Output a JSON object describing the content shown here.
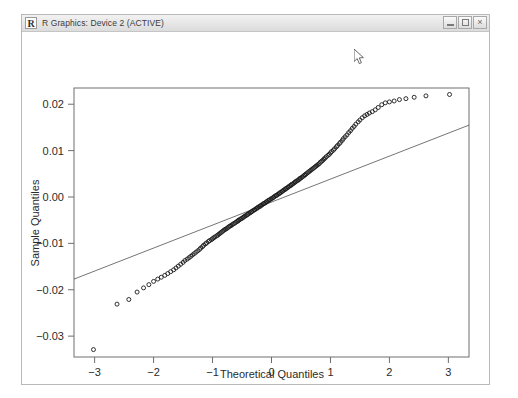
{
  "window": {
    "title": "R Graphics: Device 2 (ACTIVE)",
    "icon": "r-logo-icon",
    "icon_letter": "R",
    "controls": {
      "minimize_label": "",
      "maximize_label": "",
      "close_label": "×"
    },
    "frame_color": "#b9b9b9",
    "titlebar_color": "#e8e8e8"
  },
  "cursor": {
    "x": 357,
    "y": 55,
    "kind": "arrow-pointer"
  },
  "chart_data": {
    "type": "scatter",
    "title": "",
    "xlabel": "Theoretical Quantiles",
    "ylabel": "Sample Quantiles",
    "xlim": [
      -3.35,
      3.35
    ],
    "ylim": [
      -0.0345,
      0.0235
    ],
    "xticks": [
      -3,
      -2,
      -1,
      0,
      1,
      2,
      3
    ],
    "xtick_labels": [
      "−3",
      "−2",
      "−1",
      "0",
      "1",
      "2",
      "3"
    ],
    "yticks": [
      0.02,
      0.01,
      0.0,
      -0.01,
      -0.02,
      -0.03
    ],
    "ytick_labels": [
      "0.02",
      "0.01",
      "0.00",
      "−0.01",
      "−0.02",
      "−0.03"
    ],
    "grid": false,
    "legend": null,
    "marker": {
      "shape": "open-circle",
      "radius": 2.0,
      "color": "#1a1a1a"
    },
    "reference_line": {
      "name": "qqline",
      "color": "#3a3a3a",
      "width": 0.7,
      "x1": -3.35,
      "y1": -0.0177,
      "x2": 3.35,
      "y2": 0.0155
    },
    "series": [
      {
        "name": "Sample Quantiles",
        "x": [
          -3.02,
          -2.62,
          -2.42,
          -2.28,
          -2.17,
          -2.08,
          -2.0,
          -1.93,
          -1.87,
          -1.81,
          -1.76,
          -1.71,
          -1.66,
          -1.62,
          -1.58,
          -1.54,
          -1.5,
          -1.47,
          -1.43,
          -1.4,
          -1.37,
          -1.34,
          -1.31,
          -1.28,
          -1.25,
          -1.22,
          -1.2,
          -1.17,
          -1.15,
          -1.12,
          -1.1,
          -1.07,
          -1.05,
          -1.02,
          -1.0,
          -0.98,
          -0.96,
          -0.93,
          -0.91,
          -0.89,
          -0.87,
          -0.85,
          -0.83,
          -0.81,
          -0.79,
          -0.77,
          -0.75,
          -0.73,
          -0.71,
          -0.69,
          -0.67,
          -0.65,
          -0.63,
          -0.61,
          -0.59,
          -0.57,
          -0.56,
          -0.54,
          -0.52,
          -0.5,
          -0.48,
          -0.47,
          -0.45,
          -0.43,
          -0.41,
          -0.4,
          -0.38,
          -0.36,
          -0.34,
          -0.33,
          -0.31,
          -0.29,
          -0.28,
          -0.26,
          -0.24,
          -0.23,
          -0.21,
          -0.19,
          -0.18,
          -0.16,
          -0.14,
          -0.13,
          -0.11,
          -0.09,
          -0.08,
          -0.06,
          -0.04,
          -0.03,
          -0.01,
          0.01,
          0.03,
          0.04,
          0.06,
          0.08,
          0.09,
          0.11,
          0.13,
          0.14,
          0.16,
          0.18,
          0.19,
          0.21,
          0.23,
          0.24,
          0.26,
          0.28,
          0.29,
          0.31,
          0.33,
          0.34,
          0.36,
          0.38,
          0.4,
          0.41,
          0.43,
          0.45,
          0.47,
          0.48,
          0.5,
          0.52,
          0.54,
          0.56,
          0.57,
          0.59,
          0.61,
          0.63,
          0.65,
          0.67,
          0.69,
          0.71,
          0.73,
          0.75,
          0.77,
          0.79,
          0.81,
          0.83,
          0.85,
          0.87,
          0.89,
          0.91,
          0.93,
          0.96,
          0.98,
          1.0,
          1.02,
          1.05,
          1.07,
          1.1,
          1.12,
          1.15,
          1.17,
          1.2,
          1.22,
          1.25,
          1.28,
          1.31,
          1.34,
          1.37,
          1.4,
          1.43,
          1.47,
          1.5,
          1.54,
          1.58,
          1.62,
          1.66,
          1.71,
          1.76,
          1.81,
          1.87,
          1.93,
          2.0,
          2.08,
          2.17,
          2.28,
          2.42,
          2.62,
          3.02
        ],
        "y": [
          -0.0329,
          -0.0231,
          -0.0221,
          -0.0205,
          -0.0196,
          -0.0189,
          -0.0182,
          -0.0177,
          -0.0173,
          -0.0169,
          -0.0165,
          -0.0161,
          -0.0157,
          -0.0153,
          -0.0149,
          -0.0145,
          -0.0141,
          -0.0137,
          -0.0134,
          -0.0131,
          -0.0128,
          -0.0125,
          -0.0122,
          -0.0119,
          -0.0116,
          -0.0113,
          -0.011,
          -0.0107,
          -0.0104,
          -0.0101,
          -0.0099,
          -0.0096,
          -0.0094,
          -0.0092,
          -0.009,
          -0.0088,
          -0.0086,
          -0.0084,
          -0.0082,
          -0.008,
          -0.0078,
          -0.0076,
          -0.0074,
          -0.0072,
          -0.007,
          -0.0069,
          -0.0067,
          -0.0065,
          -0.0063,
          -0.0062,
          -0.006,
          -0.0058,
          -0.0057,
          -0.0055,
          -0.0053,
          -0.0052,
          -0.005,
          -0.0049,
          -0.0047,
          -0.0046,
          -0.0044,
          -0.0043,
          -0.0041,
          -0.004,
          -0.0038,
          -0.0037,
          -0.0035,
          -0.0034,
          -0.0032,
          -0.0031,
          -0.0029,
          -0.0028,
          -0.0027,
          -0.0025,
          -0.0024,
          -0.0022,
          -0.0021,
          -0.002,
          -0.0018,
          -0.0017,
          -0.0015,
          -0.0014,
          -0.0013,
          -0.0011,
          -0.001,
          -0.0008,
          -0.0007,
          -0.0006,
          -0.0004,
          -0.0003,
          -0.0001,
          0.0,
          0.0002,
          0.0003,
          0.0004,
          0.0006,
          0.0007,
          0.0009,
          0.001,
          0.0012,
          0.0013,
          0.0015,
          0.0016,
          0.0018,
          0.0019,
          0.0021,
          0.0022,
          0.0024,
          0.0025,
          0.0027,
          0.0028,
          0.003,
          0.0032,
          0.0033,
          0.0035,
          0.0036,
          0.0038,
          0.004,
          0.0041,
          0.0043,
          0.0045,
          0.0047,
          0.0048,
          0.005,
          0.0052,
          0.0054,
          0.0056,
          0.0058,
          0.006,
          0.0062,
          0.0064,
          0.0066,
          0.0068,
          0.007,
          0.0072,
          0.0075,
          0.0077,
          0.0079,
          0.0082,
          0.0084,
          0.0087,
          0.009,
          0.0092,
          0.0095,
          0.0098,
          0.0101,
          0.0104,
          0.0108,
          0.0111,
          0.0115,
          0.0118,
          0.0122,
          0.0126,
          0.013,
          0.0134,
          0.0139,
          0.0143,
          0.0148,
          0.0152,
          0.0157,
          0.0162,
          0.0166,
          0.0171,
          0.0175,
          0.0178,
          0.0181,
          0.0184,
          0.0188,
          0.0193,
          0.0199,
          0.0203,
          0.0205,
          0.0207,
          0.021,
          0.0212,
          0.0215,
          0.0218,
          0.0221
        ]
      }
    ]
  }
}
